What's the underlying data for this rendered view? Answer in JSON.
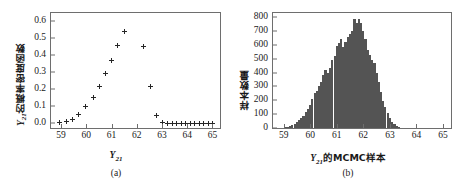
{
  "figure": {
    "panels": [
      {
        "id": "a",
        "caption": "(a)",
        "chart_data": {
          "type": "scatter",
          "title": "",
          "xlabel_prefix": "Y",
          "xlabel_sub": "21",
          "xlabel": "Y21",
          "ylabel_var": "Y",
          "ylabel_sub": "21",
          "ylabel_cjk": "的概率密度函数",
          "ylabel": "Y21的概率密度函数",
          "xlim": [
            58.6,
            65.3
          ],
          "ylim": [
            -0.03,
            0.65
          ],
          "xticks": [
            59,
            60,
            61,
            62,
            63,
            64,
            65
          ],
          "xticklabels": [
            "59",
            "60",
            "61",
            "62",
            "63",
            "64",
            "65"
          ],
          "yticks": [
            0.0,
            0.1,
            0.2,
            0.3,
            0.4,
            0.5,
            0.6
          ],
          "yticklabels": [
            "0.0",
            "0.1",
            "0.2",
            "0.3",
            "0.4",
            "0.5",
            "0.6"
          ],
          "grid": false,
          "legend": false,
          "marker": "plus",
          "marker_color": "#262626",
          "x": [
            58.95,
            59.2,
            59.45,
            59.7,
            59.95,
            60.28,
            60.52,
            60.78,
            61.0,
            61.25,
            61.52,
            62.27,
            62.55,
            62.78,
            63.02,
            63.22,
            63.4,
            63.58,
            63.76,
            63.94,
            64.12,
            64.3,
            64.48,
            64.66,
            64.84,
            65.02
          ],
          "y": [
            0.0,
            0.008,
            0.022,
            0.05,
            0.095,
            0.15,
            0.215,
            0.29,
            0.37,
            0.455,
            0.54,
            0.452,
            0.215,
            0.045,
            0.0,
            -0.004,
            -0.004,
            -0.004,
            -0.004,
            -0.004,
            -0.004,
            -0.004,
            -0.004,
            -0.004,
            -0.004,
            -0.004
          ]
        }
      },
      {
        "id": "b",
        "caption": "(b)",
        "chart_data": {
          "type": "bar",
          "title": "",
          "xlabel_prefix": "Y",
          "xlabel_sub": "21",
          "xlabel_cjk": "的MCMC样本",
          "xlabel": "Y21的MCMC样本",
          "ylabel": "样本数量",
          "xlim": [
            58.6,
            65.3
          ],
          "ylim": [
            0,
            830
          ],
          "xticks": [
            59,
            60,
            61,
            62,
            63,
            64,
            65
          ],
          "xticklabels": [
            "59",
            "60",
            "61",
            "62",
            "63",
            "64",
            "65"
          ],
          "yticks": [
            0,
            100,
            200,
            300,
            400,
            500,
            600,
            700,
            800
          ],
          "yticklabels": [
            "0",
            "100",
            "200",
            "300",
            "400",
            "500",
            "600",
            "700",
            "800"
          ],
          "grid": false,
          "legend": false,
          "bar_color": "#545454",
          "bin_width": 0.0833,
          "bin_centers": [
            59.08,
            59.17,
            59.25,
            59.33,
            59.42,
            59.5,
            59.58,
            59.67,
            59.75,
            59.83,
            59.92,
            60.0,
            60.08,
            60.17,
            60.25,
            60.33,
            60.42,
            60.5,
            60.58,
            60.67,
            60.75,
            60.83,
            60.92,
            61.0,
            61.08,
            61.17,
            61.25,
            61.33,
            61.42,
            61.5,
            61.58,
            61.67,
            61.75,
            61.83,
            61.92,
            62.0,
            62.08,
            62.17,
            62.25,
            62.33,
            62.42,
            62.5,
            62.58,
            62.67,
            62.75,
            62.83,
            62.92,
            63.0,
            63.08,
            63.17,
            63.25,
            63.33
          ],
          "counts": [
            5,
            10,
            15,
            20,
            28,
            40,
            55,
            70,
            90,
            115,
            135,
            165,
            210,
            250,
            268,
            300,
            330,
            385,
            420,
            400,
            430,
            490,
            520,
            590,
            615,
            640,
            585,
            620,
            660,
            680,
            700,
            790,
            760,
            790,
            755,
            700,
            640,
            565,
            525,
            490,
            470,
            400,
            330,
            260,
            195,
            150,
            105,
            70,
            45,
            28,
            15,
            8
          ]
        }
      }
    ]
  }
}
